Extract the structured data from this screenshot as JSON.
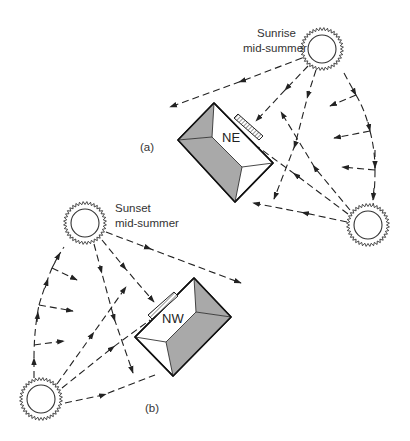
{
  "diagram": {
    "colors": {
      "line": "#222222",
      "roof_shade": "#a9a9a9",
      "roof_light": "#ffffff",
      "background": "#ffffff"
    },
    "panel_a": {
      "label": "(a)",
      "sun_label_line1": "Sunrise",
      "sun_label_line2": "mid-summer",
      "house_label": "NE",
      "suns": [
        {
          "id": "sunrise",
          "cx": 322,
          "cy": 49
        },
        {
          "id": "sunset-position",
          "cx": 368,
          "cy": 225
        }
      ]
    },
    "panel_b": {
      "label": "(b)",
      "sun_label_line1": "Sunset",
      "sun_label_line2": "mid-summer",
      "house_label": "NW",
      "suns": [
        {
          "id": "sunset",
          "cx": 85,
          "cy": 223
        },
        {
          "id": "sunrise-position",
          "cx": 41,
          "cy": 399
        }
      ]
    }
  }
}
